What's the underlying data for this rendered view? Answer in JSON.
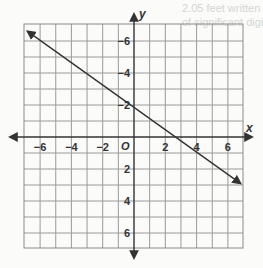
{
  "background_text": [
    {
      "text": "2.05 feet written with the correct number",
      "x": 182,
      "y": 10
    },
    {
      "text": "of significant digits",
      "x": 182,
      "y": 24
    },
    {
      "text": "Turtles can swim at a speed of 0.6 miles",
      "x": 244,
      "y": 84
    },
    {
      "text": "per minute. Convert this speed to",
      "x": 244,
      "y": 98
    },
    {
      "text": "miles per hour. The speed of a turtle is",
      "x": 244,
      "y": 112
    },
    {
      "text": "Simplify units",
      "x": 244,
      "y": 172
    }
  ],
  "chart_data": {
    "type": "line",
    "title": "",
    "xlabel": "x",
    "ylabel": "y",
    "xlim": [
      -7,
      7
    ],
    "ylim": [
      -7,
      7
    ],
    "grid": true,
    "x_ticks": [
      -6,
      -4,
      -2,
      2,
      4,
      6
    ],
    "y_ticks": [
      -6,
      -4,
      -2,
      2,
      4,
      6
    ],
    "origin_label": "O",
    "series": [
      {
        "name": "line",
        "x": [
          -6.8,
          6.8
        ],
        "y": [
          6.6,
          -2.9
        ],
        "arrows": "both"
      }
    ]
  },
  "labels": {
    "x_axis": "x",
    "y_axis": "y",
    "origin": "O",
    "x_ticks": [
      "−6",
      "−4",
      "−2",
      "2",
      "4",
      "6"
    ],
    "y_ticks": [
      "6",
      "4",
      "2",
      "−2",
      "−4",
      "−6"
    ]
  }
}
